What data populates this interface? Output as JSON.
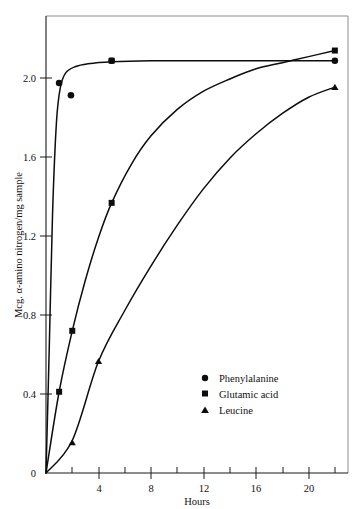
{
  "chart_data": {
    "type": "line",
    "title": "",
    "xlabel": "Hours",
    "ylabel": "Mcg. α-amino nitrogen/mg sample",
    "xlim": [
      0,
      23
    ],
    "ylim": [
      0,
      2.25
    ],
    "xticks": [
      0,
      4,
      8,
      12,
      16,
      20
    ],
    "xticklabels": [
      "0",
      "4",
      "8",
      "12",
      "16",
      "20"
    ],
    "xminorticks": [
      2,
      6,
      10,
      14,
      18,
      22
    ],
    "yticks": [
      0,
      0.4,
      0.8,
      1.2,
      1.6,
      2.0
    ],
    "yticklabels": [
      "0",
      "0.4",
      "0.8",
      "1.2",
      "1.6",
      "2.0"
    ],
    "grid": false,
    "legend_position": "center-right-lower",
    "series": [
      {
        "name": "Phenylalanine",
        "marker": "circle",
        "color": "#0d0d0d",
        "x": [
          1.0,
          1.9,
          5.0,
          22.0
        ],
        "y": [
          1.92,
          1.86,
          2.03,
          2.03
        ],
        "curve_x": [
          0.0,
          0.25,
          0.5,
          0.8,
          1.1,
          1.5,
          2.2,
          3.2,
          5.0,
          8.0,
          12.0,
          16.0,
          20.0,
          22.0
        ],
        "curve_y": [
          0.0,
          0.62,
          1.28,
          1.73,
          1.9,
          1.97,
          2.0,
          2.015,
          2.025,
          2.03,
          2.03,
          2.03,
          2.03,
          2.03
        ]
      },
      {
        "name": "Glutamic acid",
        "marker": "square",
        "color": "#0d0d0d",
        "x": [
          1.0,
          2.0,
          5.0,
          5.0,
          22.0
        ],
        "y": [
          0.4,
          0.7,
          1.33,
          2.03,
          2.08
        ],
        "curve_x": [
          0.0,
          1.0,
          2.0,
          3.0,
          4.0,
          5.0,
          6.5,
          8.0,
          10.0,
          12.0,
          14.0,
          16.0,
          18.0,
          20.0,
          22.0
        ],
        "curve_y": [
          0.0,
          0.4,
          0.7,
          0.95,
          1.16,
          1.33,
          1.52,
          1.66,
          1.79,
          1.88,
          1.94,
          1.99,
          2.02,
          2.05,
          2.08
        ]
      },
      {
        "name": "Leucine",
        "marker": "triangle",
        "color": "#0d0d0d",
        "x": [
          2.0,
          4.0,
          22.0
        ],
        "y": [
          0.15,
          0.55,
          1.9
        ],
        "curve_x": [
          0.0,
          2.0,
          4.0,
          6.0,
          8.0,
          10.0,
          12.0,
          14.0,
          16.0,
          18.0,
          20.0,
          22.0
        ],
        "curve_y": [
          0.0,
          0.16,
          0.55,
          0.8,
          1.02,
          1.22,
          1.4,
          1.55,
          1.67,
          1.77,
          1.85,
          1.9
        ]
      }
    ]
  },
  "axes": {
    "y_title": "Mcg. α-amino nitrogen/mg sample",
    "x_title": "Hours",
    "y_labels": [
      "2.0",
      "1.6",
      "1.2",
      "0.8",
      "0.4",
      "0"
    ],
    "x_labels": [
      "4",
      "8",
      "12",
      "16",
      "20"
    ]
  },
  "legend": {
    "entries": [
      {
        "label": "Phenylalanine",
        "marker": "circle-marker"
      },
      {
        "label": "Glutamic acid",
        "marker": "square-marker"
      },
      {
        "label": "Leucine",
        "marker": "triangle-marker"
      }
    ]
  }
}
